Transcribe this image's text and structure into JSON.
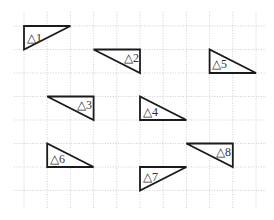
{
  "figure": {
    "width": 274,
    "height": 220,
    "background": "#ffffff",
    "grid": {
      "color": "#b8b8b8",
      "style": "dotted",
      "vertical_x": [
        24,
        47.2,
        70.4,
        93.6,
        116.8,
        140,
        163.2,
        186.4,
        209.6,
        232.8,
        256
      ],
      "horizontal_y": [
        26,
        49.5,
        73,
        96.5,
        120,
        143.5,
        167,
        190.5
      ],
      "vertical_extent": [
        12,
        208
      ],
      "horizontal_extent": [
        14,
        266
      ]
    },
    "triangles": [
      {
        "label": "△1",
        "points": [
          [
            24,
            26
          ],
          [
            70.4,
            26
          ],
          [
            24,
            49.5
          ]
        ],
        "label_pos": [
          27,
          42
        ]
      },
      {
        "label": "△2",
        "points": [
          [
            93.6,
            49.5
          ],
          [
            140,
            49.5
          ],
          [
            140,
            73
          ]
        ],
        "label_pos": [
          124,
          62
        ]
      },
      {
        "label": "△3",
        "points": [
          [
            47.2,
            96.5
          ],
          [
            93.6,
            96.5
          ],
          [
            93.6,
            120
          ]
        ],
        "label_pos": [
          77,
          109
        ]
      },
      {
        "label": "△4",
        "points": [
          [
            140,
            96.5
          ],
          [
            140,
            120
          ],
          [
            186.4,
            120
          ]
        ],
        "label_pos": [
          143,
          116
        ]
      },
      {
        "label": "△5",
        "points": [
          [
            209.6,
            49.5
          ],
          [
            209.6,
            73
          ],
          [
            256,
            73
          ]
        ],
        "label_pos": [
          212,
          68
        ]
      },
      {
        "label": "△6",
        "points": [
          [
            47.2,
            143.5
          ],
          [
            47.2,
            167
          ],
          [
            93.6,
            167
          ]
        ],
        "label_pos": [
          50,
          163
        ]
      },
      {
        "label": "△7",
        "points": [
          [
            140,
            167
          ],
          [
            186.4,
            167
          ],
          [
            140,
            190.5
          ]
        ],
        "label_pos": [
          143,
          181
        ]
      },
      {
        "label": "△8",
        "points": [
          [
            186.4,
            143.5
          ],
          [
            232.8,
            143.5
          ],
          [
            232.8,
            167
          ]
        ],
        "label_pos": [
          216,
          156
        ]
      }
    ],
    "colors": {
      "triangle_stroke": "#1a1a1a",
      "label": "#333333"
    }
  }
}
